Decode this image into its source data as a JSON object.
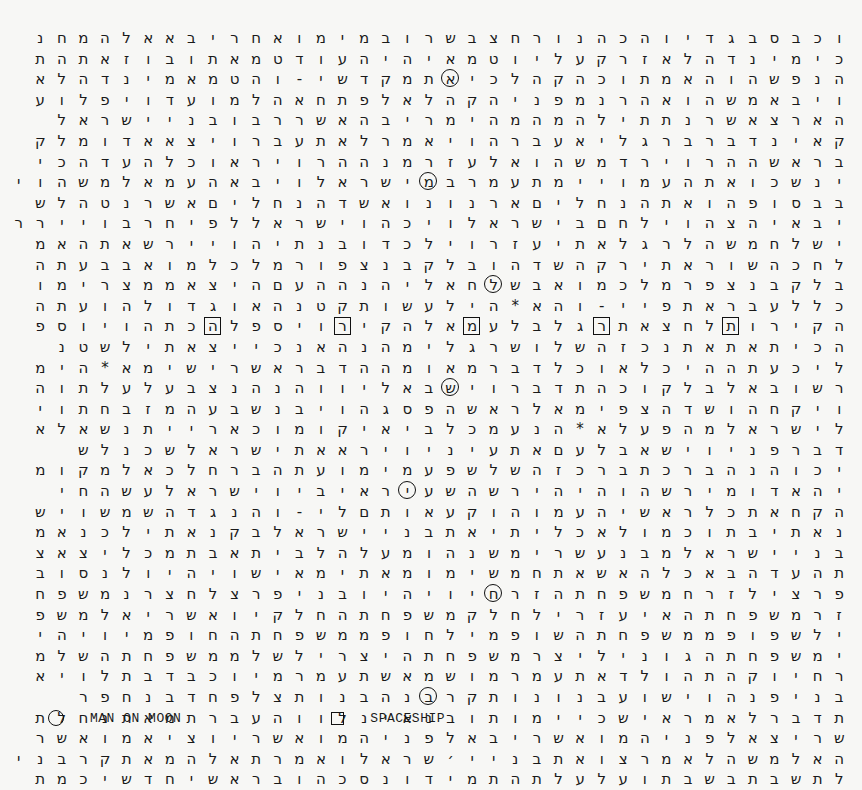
{
  "grid": {
    "direction": "rtl",
    "rows": [
      "וכבסבגדיוהכהנורחצבשרובמימואחריבאאלהמחנ",
      "כימינדהלאזרקעליוטמאיהיהעודטמאתובוזאתהת",
      "הנפשהוהאמתוכהקהלכיאתמקדשי-והטמאמינדהלא",
      "ויבאמשהואהרנמפניהקהלאלפתחאהלמועדויפלוע",
      "הארצאשרנתתילהמהמהימריבהאשררבובניישראל",
      "קאינדברבר גליאעברהויאמרלאתעברויצאאדומלק",
      "בראשההרוירדמשהואלעזרמנההרויראוכלהעדהכי",
      "ינשכואתהעמויימתעמרבמישראלויבאהעמאלמשהוי",
      "בבסופהואתהנחליםארנונואשדהנחליםאשרנטהלש",
      "יבאיהצהוילחםבישראלויכהוישראללפיחרבויירר",
      "ישלחמשהלרגלאתיעזרוילכדובנתיהויירשאתהאמ",
      "לחכהשוראתירקהשדהובלקבנצפורמלכלמואבבעתה",
      "בלקבנצפרמלכמואבשלחאליהנההעםהיצאממצרימו",
      "כללעבראתפיי-והא*היל עשותקטנהאוגדולהועתה",
      "הקירותלחצאתרגלבלעמאלהקירויספלהכתהויוספ",
      "הכיתאתאתנכזהשלושרגלימהנהאנכייצאתילשטנ",
      "ליכעתההיכלאוכלדברמאומההדבראשרישימא*הימ",
      "רשובאלבלקוכהתדברוישבאליווהנהנצבעלעלתוה",
      "ויקחהושדהצפימאלראשהפסגהויבנשבעהמזבחתוי",
      "לישראלמהפעלא*הנעמכלביאיקומוכארייתנשאלא",
      "דברפניוישאבלעםאתעיניויראאתישראלשכנלש",
      "יכוהנהברכתברכזהשלשפעמימועתהברחלכאלמקומ",
      "יהאדומירשהוהיהירשהשעירא יביוישראלעשהחי",
      "הקחאתכלראשיהעמוהוקעאותםלי-והנגדהשמשויש",
      "נאתיבתוכמולאכליתיאתבניישראלבקנאתילכנאמ",
      "בניישראלמבנעשרימשנהומעלהלביתאבתמכליצאצ",
      "תהעדהבאכלהאשאתחמשימומאתימאישויהיולנסוב",
      "פרצילזרחמשפחתהזרחיויהיובניפרצלחצרנמשפח",
      "זרמשפחתהאיעזרילחלקמשפחתהחלקיואשריאלמשפ",
      "ילשפופממשפחתהשופמילחופממשפחתהחופמיויהי",
      "ימשפחתהגונילי צרמשפחתהיצרילשלממשפחתהשלמ",
      "רחיוקהתהולדאתעמרמושמאשתעמרמיוכבדבתלויא",
      "בניפנהוישועבנונותקרבנהבנותצלפחדבנחפר",
      "תדברלאמראישכיימותובנאינלווהעברתמאתנחלת",
      "שריצאלפניהמואשריבאלפניהמואשריוציאמואשר",
      "האלמשהלאמרצואתבניי׳שראלואמרתאלהמאתקרבני",
      "לתשבתבשבתועלעלתהתמידונסכהובראשיחדשיכמת"
    ],
    "circled": [
      {
        "row": 2,
        "col": 18,
        "letter": "א"
      },
      {
        "row": 7,
        "col": 19,
        "letter": "י"
      },
      {
        "row": 12,
        "col": 16,
        "letter": "ש"
      },
      {
        "row": 17,
        "col": 18,
        "letter": "ב"
      },
      {
        "row": 22,
        "col": 20,
        "letter": "י"
      },
      {
        "row": 27,
        "col": 16,
        "letter": "פ"
      },
      {
        "row": 32,
        "col": 19,
        "letter": "ח"
      }
    ],
    "boxed": [
      {
        "row": 14,
        "col": 29,
        "letter": "ח"
      },
      {
        "row": 14,
        "col": 23,
        "letter": "ל"
      },
      {
        "row": 14,
        "col": 17,
        "letter": "ל"
      },
      {
        "row": 14,
        "col": 11,
        "letter": "י"
      },
      {
        "row": 14,
        "col": 5,
        "letter": "ת"
      }
    ]
  },
  "legend": {
    "circle_label": "MAN ON MOON",
    "square_label": "SPACESHIP"
  }
}
